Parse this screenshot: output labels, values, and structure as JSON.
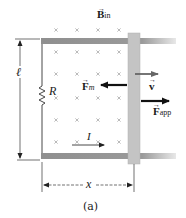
{
  "figure": {
    "caption": "(a)",
    "labels": {
      "B_field": {
        "main": "B",
        "sub": "in"
      },
      "F_magnetic": {
        "main": "F",
        "sub": "m"
      },
      "velocity": {
        "main": "v"
      },
      "F_applied": {
        "main": "F",
        "sub": "app"
      },
      "resistor": "R",
      "length": "ℓ",
      "displacement": "x",
      "current": "I"
    },
    "field_marks": {
      "symbol": "×",
      "columns_x": [
        56,
        77,
        98,
        119
      ],
      "rows_y": [
        30,
        52,
        74,
        98,
        120,
        142
      ]
    },
    "colors": {
      "rail": "#8f8f8f",
      "bar": "#c4c4c4",
      "arrow_force": "#111111",
      "arrow_velocity": "#666666",
      "marks": "#a8a8a8",
      "text": "#1a1a1a"
    }
  }
}
